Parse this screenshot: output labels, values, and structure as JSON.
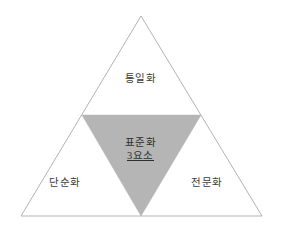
{
  "diagram": {
    "type": "triangle-venn",
    "background_color": "#ffffff",
    "outer_triangle": {
      "name": "outer-triangle",
      "stroke_color": "#b3b3b3",
      "fill_color": "#ffffff",
      "stroke_width": 1,
      "points": "141,16 262,216 21,216"
    },
    "inner_triangle": {
      "name": "inner-inverted-triangle",
      "fill_color": "#b5b5b5",
      "stroke_color": "#b5b5b5",
      "points": "82,115 201,115 141,216"
    },
    "labels": {
      "top": "통일화",
      "center_line_1": "표준화",
      "center_line_2": "3요소",
      "bottom_left": "단순화",
      "bottom_right": "전문화"
    },
    "text_color": "#3b3b3b"
  }
}
